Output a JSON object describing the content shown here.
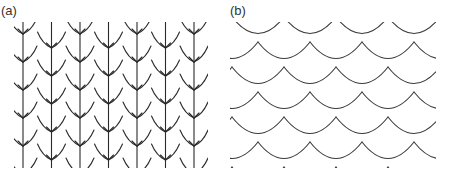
{
  "figure": {
    "panels": [
      {
        "id": "a",
        "label": "(a)",
        "description": "Leaf-like overlapping scales with vertical midribs arranged in offset columns",
        "stroke_color": "#2a2a2a"
      },
      {
        "id": "b",
        "label": "(b)",
        "description": "Overlapping fish-scale (cycloid) arcs arranged in offset rows",
        "stroke_color": "#3a3a3a"
      }
    ]
  }
}
